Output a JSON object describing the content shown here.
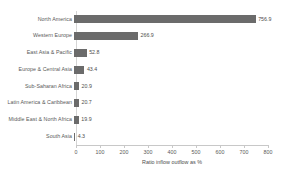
{
  "chart_data": {
    "type": "bar",
    "orientation": "horizontal",
    "title": "",
    "subtitle": "",
    "xlabel": "Ratio inflow outflow as %",
    "ylabel": "",
    "xlim": [
      0,
      800
    ],
    "xticks": [
      "0",
      "100",
      "200",
      "300",
      "400",
      "500",
      "600",
      "700",
      "800"
    ],
    "grid": false,
    "legend": false,
    "bar_color": "#6b6b6b",
    "label_color": "#595959",
    "axis_color": "#c8c8c8",
    "categories": [
      "North America",
      "Western Europe",
      "East Asia & Pacific",
      "Europe & Central Asia",
      "Sub-Saharan Africa",
      "Latin America & Caribbean",
      "Middle East & North Africa",
      "South Asia"
    ],
    "values": [
      756.9,
      266.9,
      52.8,
      43.4,
      20.9,
      20.7,
      19.9,
      4.3
    ],
    "value_labels": [
      "756.9",
      "266.9",
      "52.8",
      "43.4",
      "20.9",
      "20.7",
      "19.9",
      "4.3"
    ],
    "series": [
      {
        "name": "Ratio inflow outflow as %",
        "values": [
          756.9,
          266.9,
          52.8,
          43.4,
          20.9,
          20.7,
          19.9,
          4.3
        ]
      }
    ]
  }
}
